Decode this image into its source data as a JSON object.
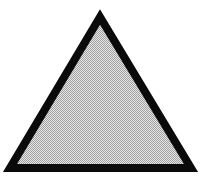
{
  "shape": {
    "type": "triangle",
    "points": "100,17 10,168 191,168",
    "stroke_color": "#0a0a0a",
    "stroke_width": 8,
    "fill_dot_color": "#a0a0a0",
    "fill_bg_color": "#e6e6e6"
  },
  "background": "#ffffff"
}
